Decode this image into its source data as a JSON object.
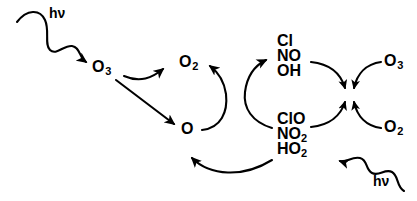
{
  "diagram": {
    "type": "reaction-cycle",
    "background_color": "#ffffff",
    "stroke_color": "#000000",
    "text_color": "#000000"
  },
  "photons": [
    {
      "name": "photon-top-left",
      "label_h": "h",
      "label_nu": "ν"
    },
    {
      "name": "photon-bottom-right",
      "label_h": "h",
      "label_nu": "ν"
    }
  ],
  "species": {
    "ozone_left": {
      "formula": "O",
      "sub": "3"
    },
    "oxygen_molecule_center": {
      "formula": "O",
      "sub": "2"
    },
    "oxygen_atom_center": {
      "formula": "O",
      "sub": ""
    },
    "ozone_right": {
      "formula": "O",
      "sub": "3"
    },
    "oxygen_molecule_right": {
      "formula": "O",
      "sub": "2"
    }
  },
  "radical_stack": {
    "name": "radical-reservoir",
    "lines": [
      {
        "text": "Cl",
        "sub": ""
      },
      {
        "text": "NO",
        "sub": ""
      },
      {
        "text": "OH",
        "sub": ""
      }
    ]
  },
  "oxide_stack": {
    "name": "oxide-reservoir",
    "lines": [
      {
        "text": "ClO",
        "sub": ""
      },
      {
        "text": "NO",
        "sub": "2"
      },
      {
        "text": "HO",
        "sub": "2"
      }
    ]
  },
  "arrows": [
    {
      "name": "arrow-photon-to-ozone",
      "kind": "wavy"
    },
    {
      "name": "arrow-ozone-to-oxygen-molecule",
      "kind": "curved"
    },
    {
      "name": "arrow-ozone-to-oxygen-atom",
      "kind": "straight"
    },
    {
      "name": "arrow-oxygen-atom-to-oxygen-molecule",
      "kind": "curved"
    },
    {
      "name": "arrow-oxide-to-radical",
      "kind": "curved"
    },
    {
      "name": "arrow-oxide-to-oxygen-atom",
      "kind": "curved"
    },
    {
      "name": "arrow-radical-to-junction",
      "kind": "curved"
    },
    {
      "name": "arrow-ozone-right-to-junction",
      "kind": "curved"
    },
    {
      "name": "arrow-oxide-to-junction",
      "kind": "curved"
    },
    {
      "name": "arrow-oxygen-right-to-junction",
      "kind": "curved"
    },
    {
      "name": "arrow-photon-to-oxide",
      "kind": "wavy"
    }
  ]
}
